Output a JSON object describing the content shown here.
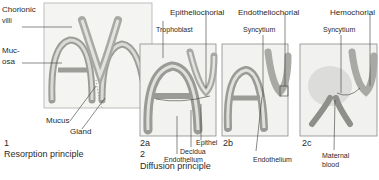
{
  "figure": {
    "panel1": {
      "number": "1",
      "title": "Resorption principle",
      "labels": {
        "chorionic_villi_line1": "Chorionic",
        "chorionic_villi_line2": "villi",
        "mucosa_line1": "Muc-",
        "mucosa_line2": "osa",
        "mucus": "Mucus",
        "gland": "Gland"
      }
    },
    "panel2": {
      "number": "2",
      "title": "Diffusion principle",
      "subpanels": [
        {
          "id": "2a",
          "type": "Epitheliochorial",
          "labels": {
            "trophoblast": "Trophoblast",
            "epithel": "Epithel",
            "decidua": "Decidua",
            "endothelium": "Endothelium"
          }
        },
        {
          "id": "2b",
          "type": "Endotheliochorial",
          "labels": {
            "syncytium": "Syncytium",
            "endothelium": "Endothelium"
          }
        },
        {
          "id": "2c",
          "type": "Hemochorial",
          "labels": {
            "syncytium": "Syncytium",
            "maternal_blood_line1": "Maternal",
            "maternal_blood_line2": "blood"
          }
        }
      ]
    },
    "colors": {
      "background": "#ffffff",
      "panel_fill": "#f3f3f1",
      "panel_border": "#9a9a9a",
      "tissue_gray": "#b8b8b4",
      "tissue_dark": "#8e8e8a",
      "line": "#3a3a3a",
      "blood_gray": "#d4d4d2"
    }
  }
}
